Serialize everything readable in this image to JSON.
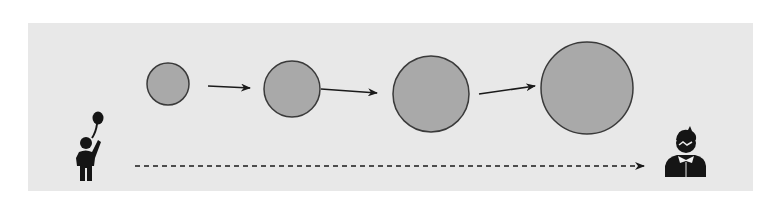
{
  "diagram": {
    "background": "#ffffff",
    "panel": {
      "x": 28,
      "y": 23,
      "width": 725,
      "height": 168,
      "fill": "#e8e8e8"
    },
    "circle_style": {
      "fill": "#a9a9a9",
      "stroke": "#3a3a3a",
      "stroke_width": 1.5
    },
    "circles": [
      {
        "id": "stage-1",
        "cx": 168,
        "cy": 84,
        "r": 21
      },
      {
        "id": "stage-2",
        "cx": 292,
        "cy": 89,
        "r": 28
      },
      {
        "id": "stage-3",
        "cx": 431,
        "cy": 94,
        "r": 38
      },
      {
        "id": "stage-4",
        "cx": 587,
        "cy": 88,
        "r": 46
      }
    ],
    "arrows": [
      {
        "id": "arrow-1",
        "x1": 208,
        "y1": 86,
        "x2": 250,
        "y2": 88
      },
      {
        "id": "arrow-2",
        "x1": 321,
        "y1": 89,
        "x2": 377,
        "y2": 93
      },
      {
        "id": "arrow-3",
        "x1": 479,
        "y1": 94,
        "x2": 535,
        "y2": 86
      }
    ],
    "timeline_arrow": {
      "x1": 135,
      "y1": 166,
      "x2": 644,
      "y2": 166,
      "style": "dashed"
    },
    "icons": {
      "start": "child-with-balloon-icon",
      "end": "adult-person-icon"
    },
    "line_color": "#1a1a1a",
    "icon_color": "#151515"
  }
}
